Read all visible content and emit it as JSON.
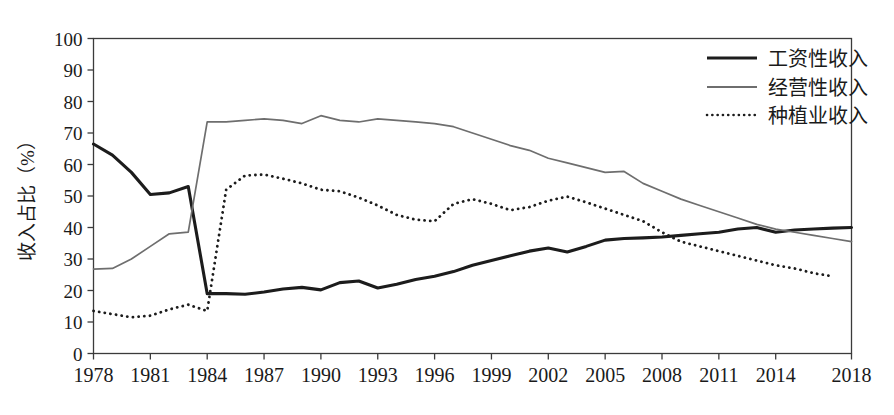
{
  "chart_data": {
    "type": "line",
    "title": "",
    "xlabel": "",
    "ylabel": "收入占比（%）",
    "xlim": [
      1978,
      2018
    ],
    "ylim": [
      0,
      100
    ],
    "grid": false,
    "legend_position": "top-right",
    "y_ticks": [
      0,
      10,
      20,
      30,
      40,
      50,
      60,
      70,
      80,
      90,
      100
    ],
    "y_tick_labels": [
      "0",
      "10",
      "20",
      "30",
      "40",
      "50",
      "60",
      "70",
      "80",
      "90",
      "100"
    ],
    "x_ticks": [
      1978,
      1981,
      1984,
      1987,
      1990,
      1993,
      1996,
      1999,
      2002,
      2005,
      2008,
      2011,
      2014,
      2018
    ],
    "x_tick_labels": [
      "1978",
      "1981",
      "1984",
      "1987",
      "1990",
      "1993",
      "1996",
      "1999",
      "2002",
      "2005",
      "2008",
      "2011",
      "2014",
      "2018"
    ],
    "x": [
      1978,
      1979,
      1980,
      1981,
      1982,
      1983,
      1984,
      1985,
      1986,
      1987,
      1988,
      1989,
      1990,
      1991,
      1992,
      1993,
      1994,
      1995,
      1996,
      1997,
      1998,
      1999,
      2000,
      2001,
      2002,
      2003,
      2004,
      2005,
      2006,
      2007,
      2008,
      2009,
      2010,
      2011,
      2012,
      2013,
      2014,
      2015,
      2016,
      2017,
      2018
    ],
    "series": [
      {
        "name": "工资性收入",
        "style": "solid-thick-black",
        "color": "#1c1c1c",
        "values": [
          66.5,
          63.0,
          57.5,
          50.5,
          51.0,
          53.0,
          19.0,
          19.0,
          18.8,
          19.5,
          20.5,
          21.0,
          20.2,
          22.5,
          23.0,
          20.8,
          22.0,
          23.5,
          24.5,
          26.0,
          28.0,
          29.5,
          31.0,
          32.5,
          33.5,
          32.2,
          34.0,
          36.0,
          36.5,
          36.7,
          37.0,
          37.5,
          38.0,
          38.5,
          39.5,
          40.0,
          38.5,
          39.2,
          39.5,
          39.8,
          40.0
        ]
      },
      {
        "name": "经营性收入",
        "style": "solid-thin-gray",
        "color": "#6e6e6e",
        "values": [
          26.8,
          27.0,
          30.0,
          34.0,
          38.0,
          38.5,
          73.5,
          73.5,
          74.0,
          74.5,
          74.0,
          73.0,
          75.5,
          74.0,
          73.5,
          74.5,
          74.0,
          73.5,
          73.0,
          72.0,
          70.0,
          68.0,
          66.0,
          64.5,
          62.0,
          60.5,
          59.0,
          57.5,
          57.8,
          54.0,
          51.5,
          49.0,
          47.0,
          45.0,
          43.0,
          41.0,
          39.5,
          38.5,
          37.5,
          36.5,
          35.5
        ]
      },
      {
        "name": "种植业收入",
        "style": "dotted-black",
        "color": "#1c1c1c",
        "values": [
          13.5,
          12.5,
          11.5,
          12.0,
          14.0,
          15.5,
          13.5,
          52.0,
          56.5,
          56.8,
          55.5,
          54.0,
          52.0,
          51.5,
          49.5,
          47.0,
          44.0,
          42.5,
          42.0,
          47.5,
          49.0,
          47.5,
          45.5,
          46.5,
          48.5,
          49.8,
          48.0,
          46.0,
          44.0,
          42.0,
          38.5,
          35.5,
          34.0,
          32.5,
          31.0,
          29.5,
          28.0,
          27.0,
          25.5,
          24.5,
          null
        ]
      }
    ],
    "annotations": []
  },
  "legend": {
    "entries": [
      {
        "label": "工资性收入",
        "marker": "thick-solid-line"
      },
      {
        "label": "经营性收入",
        "marker": "thin-solid-line"
      },
      {
        "label": "种植业收入",
        "marker": "dotted-line"
      }
    ]
  }
}
